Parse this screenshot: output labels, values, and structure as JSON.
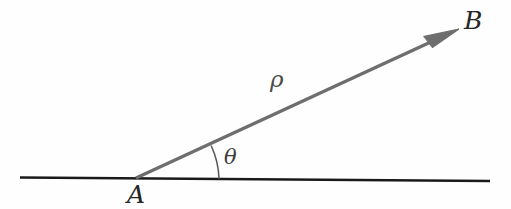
{
  "figure": {
    "type": "geometry-diagram",
    "background_color": "#fefefe",
    "width": 511,
    "height": 209,
    "labels": {
      "point_a": "A",
      "point_b": "B",
      "angle": "θ",
      "magnitude": "ρ"
    },
    "colors": {
      "baseline": "#1a1a1a",
      "ray": "#6e6e6e",
      "arc": "#555555",
      "label": "#262626"
    },
    "geometry": {
      "baseline": {
        "x1": 20,
        "y1": 178,
        "x2": 490,
        "y2": 181
      },
      "ray": {
        "x1": 136,
        "y1": 178,
        "x2": 459,
        "y2": 29
      },
      "arc": {
        "cx": 136,
        "cy": 178,
        "radius": 83,
        "start_angle_deg": 0,
        "end_angle_deg": 24.8
      },
      "arrowhead": {
        "tip_x": 459,
        "tip_y": 29,
        "length": 33,
        "half_width": 9
      }
    }
  }
}
